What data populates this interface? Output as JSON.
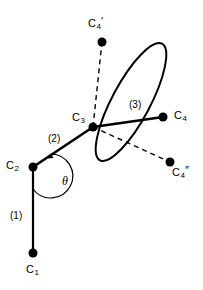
{
  "figure": {
    "background_color": "#ffffff",
    "stroke_color": "#000000",
    "width": 203,
    "height": 290
  },
  "joints": [
    {
      "id": "C1",
      "label_base": "C",
      "label_sub": "1",
      "label_prime": "",
      "x": 33,
      "y": 253,
      "label_x": 26,
      "label_y": 264,
      "radius": 4.5
    },
    {
      "id": "C2",
      "label_base": "C",
      "label_sub": "2",
      "label_prime": "",
      "x": 33,
      "y": 167,
      "label_x": 6,
      "label_y": 160,
      "radius": 4.5
    },
    {
      "id": "C3",
      "label_base": "C",
      "label_sub": "3",
      "label_prime": "",
      "x": 93,
      "y": 127,
      "label_x": 72,
      "label_y": 112,
      "radius": 4.5
    },
    {
      "id": "C4",
      "label_base": "C",
      "label_sub": "4",
      "label_prime": "",
      "x": 163,
      "y": 117,
      "label_x": 174,
      "label_y": 110,
      "radius": 4.5
    },
    {
      "id": "C4prime",
      "label_base": "C",
      "label_sub": "4",
      "label_prime": "′",
      "x": 102,
      "y": 42,
      "label_x": 88,
      "label_y": 16,
      "radius": 4.5
    },
    {
      "id": "C4doubleprime",
      "label_base": "C",
      "label_sub": "4",
      "label_prime": "″",
      "x": 170,
      "y": 162,
      "label_x": 172,
      "label_y": 165,
      "radius": 4.5
    }
  ],
  "links": [
    {
      "id": "link1",
      "label": "(1)",
      "from": "C1",
      "to": "C2",
      "style": "solid",
      "label_x": 10,
      "label_y": 211
    },
    {
      "id": "link2",
      "label": "(2)",
      "from": "C2",
      "to": "C3",
      "style": "solid",
      "label_x": 48,
      "label_y": 134
    },
    {
      "id": "link3",
      "label": "(3)",
      "from": "C3",
      "to": "C4",
      "style": "solid",
      "label_x": 129,
      "label_y": 100
    }
  ],
  "dashed_links": [
    {
      "id": "link3-prime",
      "from": "C3",
      "to": "C4prime",
      "style": "dashed"
    },
    {
      "id": "link3-doubleprime",
      "from": "C3",
      "to": "C4doubleprime",
      "style": "dashed"
    }
  ],
  "rotation_circle": {
    "id": "rotation-ellipse",
    "description": "circle of rotation shown in perspective as a tilted ellipse",
    "center_x": 131,
    "center_y": 102,
    "rx": 19,
    "ry": 66,
    "rotation_deg": 28
  },
  "angle": {
    "id": "theta",
    "symbol": "θ",
    "vertex": "C2",
    "label_x": 62,
    "label_y": 175,
    "arc_radius": 22
  }
}
